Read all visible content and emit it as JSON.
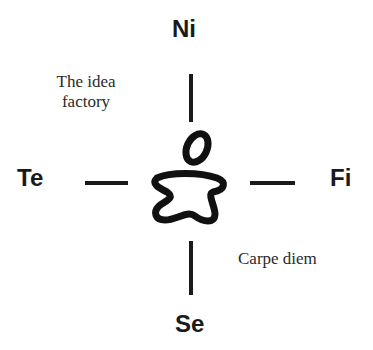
{
  "diagram": {
    "type": "cross-axis function diagram",
    "labels": {
      "top": "Ni",
      "left": "Te",
      "right": "Fi",
      "bottom": "Se"
    },
    "annotations": {
      "top_left_line1": "The idea",
      "top_left_line2": "factory",
      "bottom_right": "Carpe diem"
    },
    "center_icon": "person-figure-icon",
    "colors": {
      "ink": "#1a1a1a",
      "background": "#ffffff"
    }
  }
}
